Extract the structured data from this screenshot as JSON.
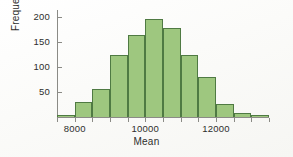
{
  "chart_data": {
    "type": "bar",
    "title": "",
    "subtitle": "",
    "xlabel": "Mean",
    "ylabel": "Frequency",
    "grid": false,
    "legend": "none",
    "xlim": [
      7500,
      13500
    ],
    "ylim": [
      0,
      215
    ],
    "x_ticks": [
      8000,
      10000,
      12000
    ],
    "x_tick_labels": [
      "8000",
      "10000",
      "12000"
    ],
    "y_ticks": [
      50,
      100,
      150,
      200
    ],
    "y_tick_labels": [
      "50",
      "100",
      "150",
      "200"
    ],
    "bin_width": 500,
    "bin_edges": [
      7500,
      8000,
      8500,
      9000,
      9500,
      10000,
      10500,
      11000,
      11500,
      12000,
      12500,
      13000,
      13500
    ],
    "categories": [
      "7500-8000",
      "8000-8500",
      "8500-9000",
      "9000-9500",
      "9500-10000",
      "10000-10500",
      "10500-11000",
      "11000-11500",
      "11500-12000",
      "12000-12500",
      "12500-13000",
      "13000-13500"
    ],
    "values": [
      5,
      30,
      57,
      125,
      165,
      197,
      178,
      124,
      81,
      27,
      9,
      5
    ],
    "bar_fill_color": "#9ec77f",
    "bar_border_color": "#4f7a43",
    "axis_color": "#8b8b86",
    "text_color": "#2e2e2c"
  },
  "axes": {
    "x_title": "Mean",
    "y_title": "Frequency"
  },
  "ticks": {
    "y": [
      {
        "label": "200",
        "value": 200
      },
      {
        "label": "150",
        "value": 150
      },
      {
        "label": "100",
        "value": 100
      },
      {
        "label": "50",
        "value": 50
      }
    ],
    "x": [
      {
        "label": "8000",
        "value": 8000
      },
      {
        "label": "10000",
        "value": 10000
      },
      {
        "label": "12000",
        "value": 12000
      }
    ]
  }
}
